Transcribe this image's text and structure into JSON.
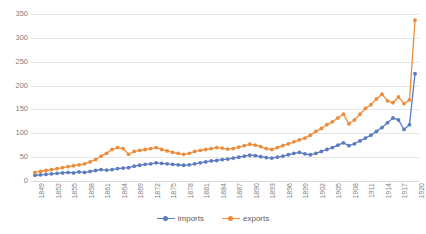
{
  "chart_data": {
    "type": "line",
    "title": "",
    "subtitle": "",
    "xlabel": "",
    "ylabel": "",
    "ylim": [
      0,
      350
    ],
    "yticks": [
      0,
      50,
      100,
      150,
      200,
      250,
      300,
      350
    ],
    "grid": true,
    "legend_position": "bottom",
    "markers": true,
    "xtick_step_years": 3,
    "xtick_labels": [
      "1849",
      "1852",
      "1855",
      "1858",
      "1861",
      "1864",
      "1869",
      "1872",
      "1875",
      "1878",
      "1881",
      "1884",
      "1887",
      "1890",
      "1893",
      "1896",
      "1899",
      "1902",
      "1905",
      "1908",
      "1911",
      "1914",
      "1917",
      "1920"
    ],
    "x": [
      1849,
      1850,
      1851,
      1852,
      1853,
      1854,
      1855,
      1856,
      1857,
      1858,
      1859,
      1860,
      1861,
      1862,
      1863,
      1864,
      1865,
      1866,
      1869,
      1870,
      1871,
      1872,
      1873,
      1874,
      1875,
      1876,
      1877,
      1878,
      1879,
      1880,
      1881,
      1882,
      1883,
      1884,
      1885,
      1886,
      1887,
      1888,
      1889,
      1890,
      1891,
      1892,
      1893,
      1894,
      1895,
      1896,
      1897,
      1898,
      1899,
      1900,
      1901,
      1902,
      1903,
      1904,
      1905,
      1906,
      1907,
      1908,
      1909,
      1910,
      1911,
      1912,
      1913,
      1914,
      1915,
      1916,
      1917,
      1918,
      1919,
      1920
    ],
    "series": [
      {
        "name": "imports",
        "color": "#5b7cc0",
        "values": [
          12,
          13,
          14,
          15,
          16,
          17,
          18,
          17,
          19,
          18,
          20,
          22,
          24,
          23,
          24,
          26,
          27,
          28,
          31,
          33,
          35,
          36,
          38,
          37,
          36,
          35,
          34,
          33,
          34,
          36,
          38,
          40,
          42,
          43,
          45,
          46,
          48,
          50,
          52,
          54,
          53,
          51,
          49,
          48,
          50,
          52,
          55,
          58,
          60,
          57,
          55,
          58,
          62,
          66,
          70,
          75,
          80,
          74,
          78,
          84,
          90,
          96,
          104,
          112,
          122,
          132,
          128,
          108,
          118,
          225
        ]
      },
      {
        "name": "exports",
        "color": "#ed8d3c",
        "values": [
          18,
          20,
          22,
          24,
          26,
          28,
          30,
          32,
          34,
          36,
          40,
          45,
          52,
          58,
          66,
          70,
          68,
          56,
          62,
          64,
          66,
          68,
          70,
          66,
          63,
          60,
          58,
          56,
          58,
          62,
          64,
          66,
          68,
          70,
          69,
          67,
          68,
          71,
          74,
          77,
          75,
          72,
          68,
          66,
          70,
          74,
          78,
          82,
          86,
          90,
          96,
          104,
          110,
          118,
          124,
          132,
          140,
          120,
          128,
          140,
          152,
          160,
          172,
          182,
          168,
          164,
          176,
          162,
          170,
          337
        ]
      }
    ]
  },
  "legend": {
    "items": [
      {
        "label": "imports",
        "color": "#5b7cc0",
        "icon": "line-marker-icon"
      },
      {
        "label": "exports",
        "color": "#ed8d3c",
        "icon": "line-marker-icon"
      }
    ]
  },
  "colors": {
    "imports": "#5b7cc0",
    "exports": "#ed8d3c",
    "gridline": "#e6e6e6",
    "tick_text": "#7f7f7f",
    "background": "#ffffff"
  }
}
